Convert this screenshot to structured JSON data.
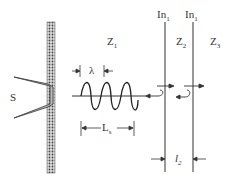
{
  "labels": {
    "source": "S",
    "z1": "Z",
    "z1_sub": "1",
    "z2": "Z",
    "z2_sub": "2",
    "z3": "Z",
    "z3_sub": "3",
    "in1_left": "In",
    "in1_left_sub": "1",
    "in1_right": "In",
    "in1_right_sub": "1",
    "lambda": "λ",
    "ls": "L",
    "ls_sub": "s",
    "l2": "l",
    "l2_sub": "2"
  },
  "colors": {
    "line": "#333333",
    "wall": "#555555",
    "horn": "#aaaaaa"
  }
}
